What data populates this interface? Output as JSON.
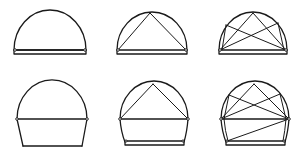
{
  "figure": {
    "stroke_color": "#1a1a1a",
    "background": "#ffffff",
    "rows": [
      {
        "label": "semicircular arch on base beam",
        "panels": [
          {
            "id": "top-1",
            "variant": "plain arch"
          },
          {
            "id": "top-2",
            "variant": "arch with single inscribed triangle"
          },
          {
            "id": "top-3",
            "variant": "arch with crossed diagonal bracing"
          }
        ]
      },
      {
        "label": "raised arch on splayed walls",
        "panels": [
          {
            "id": "bottom-1",
            "variant": "plain raised arch with tie"
          },
          {
            "id": "bottom-2",
            "variant": "raised arch with inscribed triangle"
          },
          {
            "id": "bottom-3",
            "variant": "raised arch with crossed bracing and wall diagonal"
          }
        ]
      }
    ]
  }
}
